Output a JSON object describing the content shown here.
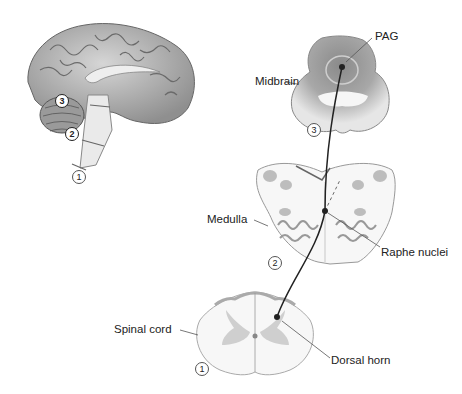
{
  "figure": {
    "brain": {
      "markers": [
        {
          "id": "1",
          "label": "1"
        },
        {
          "id": "2",
          "label": "2"
        },
        {
          "id": "3",
          "label": "3"
        }
      ]
    },
    "sections": [
      {
        "name": "Midbrain",
        "number": "3",
        "structure_label": "PAG"
      },
      {
        "name": "Medulla",
        "number": "2",
        "structure_label": "Raphe nuclei"
      },
      {
        "name": "Spinal cord",
        "number": "1",
        "structure_label": "Dorsal horn"
      }
    ]
  },
  "colors": {
    "pathway": "#222222",
    "tissue_light": "#f2f2f2",
    "tissue_gray": "#bdbdbd",
    "tissue_dark": "#7a7a7a",
    "outline": "#888888"
  }
}
